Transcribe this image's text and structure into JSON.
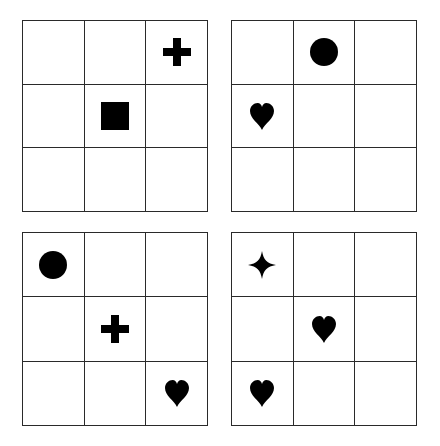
{
  "colors": {
    "line": "#2a2a2a",
    "symbol": "#000000",
    "background": "#ffffff"
  },
  "grids": [
    {
      "name": "top-left",
      "cells": [
        "",
        "",
        "plus",
        "",
        "square",
        "",
        "",
        "",
        ""
      ]
    },
    {
      "name": "top-right",
      "cells": [
        "",
        "circle",
        "",
        "heart",
        "",
        "",
        "",
        "",
        ""
      ]
    },
    {
      "name": "bottom-left",
      "cells": [
        "circle",
        "",
        "",
        "",
        "plus",
        "",
        "",
        "",
        "heart"
      ]
    },
    {
      "name": "bottom-right",
      "cells": [
        "star4",
        "",
        "",
        "",
        "heart",
        "",
        "heart",
        "",
        ""
      ]
    }
  ]
}
